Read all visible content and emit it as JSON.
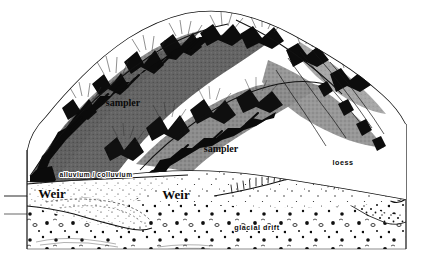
{
  "figure": {
    "kind": "geologic-block-diagram",
    "width": 433,
    "height": 262,
    "background_color": "#ffffff",
    "ink_color": "#111111"
  },
  "labels": {
    "sampler_upper": "sampler",
    "sampler_lower": "sampler",
    "weir_left": "Weir",
    "weir_right": "Weir",
    "alluvium": "alluvium / colluvium",
    "loess": "loess",
    "glacial_drift": "glacial drift"
  },
  "units": [
    {
      "id": "alluvium",
      "name": "alluvium / colluvium",
      "pattern": "fine-stipple"
    },
    {
      "id": "loess",
      "name": "loess",
      "pattern": "sparse-dot-stipple"
    },
    {
      "id": "glacial-drift",
      "name": "glacial drift",
      "pattern": "coarse-pebble-stipple"
    }
  ],
  "features": [
    {
      "id": "weir-left",
      "name": "Weir",
      "type": "gaging-structure"
    },
    {
      "id": "weir-right",
      "name": "Weir",
      "type": "gaging-structure"
    },
    {
      "id": "sampler-upper",
      "name": "sampler",
      "type": "sediment-sampler"
    },
    {
      "id": "sampler-lower",
      "name": "sampler",
      "type": "sediment-sampler"
    }
  ],
  "palette": {
    "ink": "#111111",
    "hillshade_mid": "#8a8a8a",
    "hillshade_dark": "#5e5e5e",
    "channel_black": "#0b0b0b",
    "paper": "#ffffff"
  }
}
